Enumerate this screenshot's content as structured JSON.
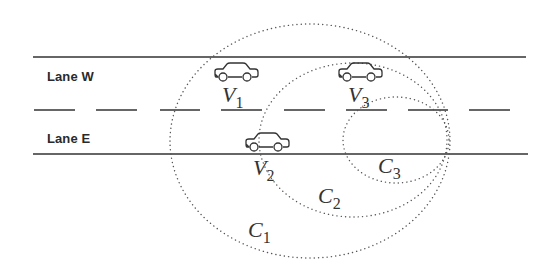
{
  "diagram": {
    "lanes": [
      {
        "id": "W",
        "label": "Lane W",
        "x": 47,
        "y": 69
      },
      {
        "id": "E",
        "label": "Lane E",
        "x": 47,
        "y": 131
      }
    ],
    "road": {
      "top_line": {
        "x1": 33,
        "x2": 526,
        "y": 57
      },
      "bottom_line": {
        "x1": 33,
        "x2": 528,
        "y": 154
      },
      "center_dashes_y": 110,
      "center_dashes": [
        [
          34,
          75
        ],
        [
          96,
          137
        ],
        [
          160,
          200
        ],
        [
          221,
          262
        ],
        [
          284,
          325
        ],
        [
          346,
          387
        ],
        [
          408,
          448
        ],
        [
          469,
          510
        ]
      ],
      "line_color": "#333333"
    },
    "vehicles": [
      {
        "id": "V1",
        "name": "V",
        "sub": "1",
        "car_x": 212,
        "car_y": 62,
        "label_x": 222,
        "label_y": 84
      },
      {
        "id": "V2",
        "name": "V",
        "sub": "2",
        "car_x": 243,
        "car_y": 132,
        "label_x": 253,
        "label_y": 157
      },
      {
        "id": "V3",
        "name": "V",
        "sub": "3",
        "car_x": 336,
        "car_y": 62,
        "label_x": 348,
        "label_y": 84
      }
    ],
    "ranges": [
      {
        "id": "C1",
        "name": "C",
        "sub": "1",
        "cx": 310,
        "cy": 141,
        "rx": 140,
        "ry": 117,
        "label_x": 248,
        "label_y": 219
      },
      {
        "id": "C2",
        "name": "C",
        "sub": "2",
        "cx": 353,
        "cy": 140,
        "rx": 94,
        "ry": 77,
        "label_x": 318,
        "label_y": 185
      },
      {
        "id": "C3",
        "name": "C",
        "sub": "3",
        "cx": 396,
        "cy": 140,
        "rx": 53,
        "ry": 43,
        "label_x": 378,
        "label_y": 155
      }
    ],
    "circle_color": "#555555"
  }
}
